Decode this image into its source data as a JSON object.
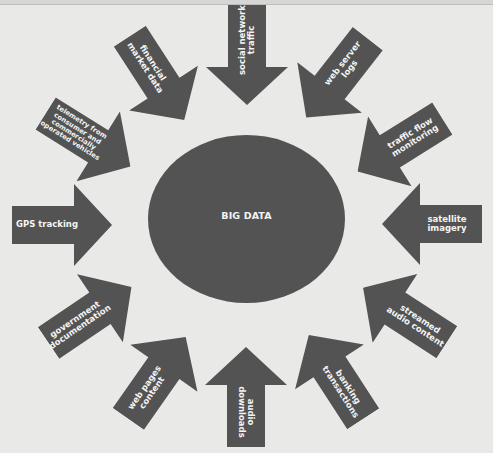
{
  "diagram": {
    "center": {
      "label": "BIG DATA"
    },
    "colors": {
      "background": "#e9e9e7",
      "shape_fill": "#535353",
      "text": "#f4f4f4"
    },
    "sources": [
      {
        "label": "social network traffic",
        "direction": "down"
      },
      {
        "label": "web server logs",
        "direction": "down-left"
      },
      {
        "label": "traffic flow monitoring",
        "direction": "down-left"
      },
      {
        "label": "satellite imagery",
        "direction": "left"
      },
      {
        "label": "streamed audio content",
        "direction": "up-left"
      },
      {
        "label": "banking transactions",
        "direction": "up-left"
      },
      {
        "label": "audio downloads",
        "direction": "up"
      },
      {
        "label": "web pages content",
        "direction": "up-right"
      },
      {
        "label": "government documentation",
        "direction": "up-right"
      },
      {
        "label": "GPS tracking",
        "direction": "right"
      },
      {
        "label": "telemetry from consumer and commercially operated vehicles",
        "direction": "down-right"
      },
      {
        "label": "financial market data",
        "direction": "down-right"
      }
    ]
  }
}
